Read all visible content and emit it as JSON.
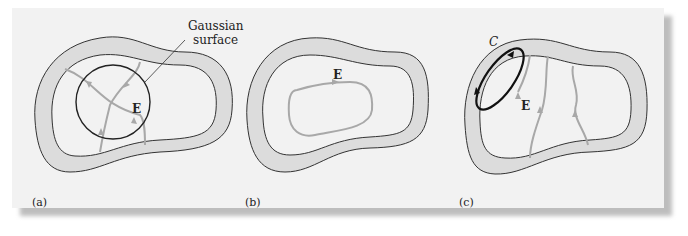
{
  "figure": {
    "panels": [
      {
        "id": "a",
        "label": "(a)",
        "field_label": "E",
        "callout": [
          "Gaussian",
          "surface"
        ]
      },
      {
        "id": "b",
        "label": "(b)",
        "field_label": "E"
      },
      {
        "id": "c",
        "label": "(c)",
        "field_label": "E",
        "loop_label": "C"
      }
    ],
    "colors": {
      "background": "#f2f2f2",
      "conductor_fill": "#dcdcdc",
      "outline": "#333333",
      "field_line": "#a8a8a8",
      "loop": "#111111"
    }
  }
}
